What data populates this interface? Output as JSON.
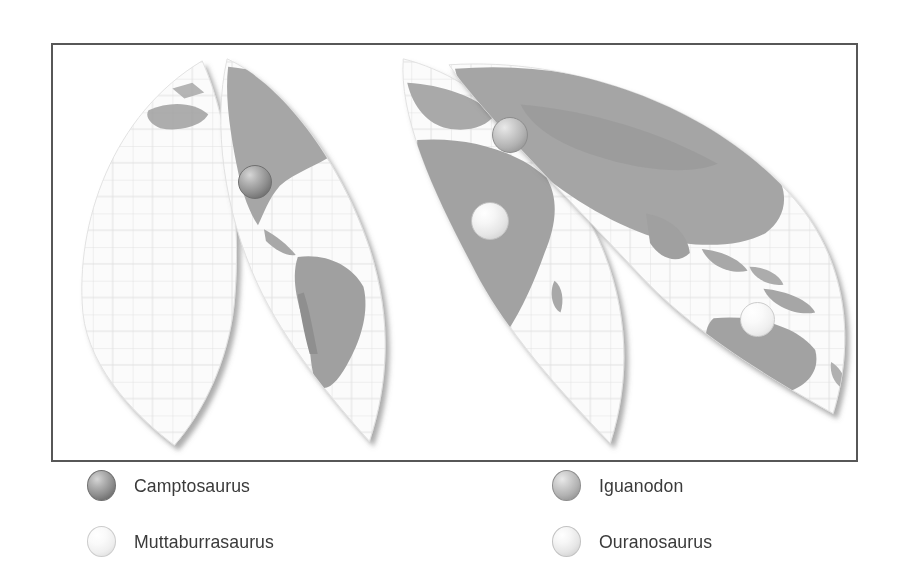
{
  "figure": {
    "type": "distribution-map",
    "projection": "interrupted-goode-homolosine",
    "frame_border_color": "#575757",
    "background_color": "#ffffff",
    "land_color": "#a8a8a8",
    "ocean_color": "#fafafa",
    "graticule_color": "#d8d8d8"
  },
  "map": {
    "markers": [
      {
        "name": "Camptosaurus",
        "region": "North America",
        "x": 253,
        "y": 180,
        "diameter": 34,
        "shade": "sph-dark"
      },
      {
        "name": "Iguanodon",
        "region": "Europe",
        "x": 508,
        "y": 133,
        "diameter": 36,
        "shade": "sph-mid"
      },
      {
        "name": "Ouranosaurus",
        "region": "Africa",
        "x": 488,
        "y": 219,
        "diameter": 38,
        "shade": "sph-light"
      },
      {
        "name": "Muttaburrasaurus",
        "region": "Australia",
        "x": 755,
        "y": 317,
        "diameter": 35,
        "shade": "sph-pale"
      }
    ]
  },
  "legend": {
    "entries": [
      {
        "label": "Camptosaurus",
        "shade": "sph-dark",
        "column": 0,
        "row": 0
      },
      {
        "label": "Muttaburrasaurus",
        "shade": "sph-pale",
        "column": 0,
        "row": 1
      },
      {
        "label": "Iguanodon",
        "shade": "sph-mid",
        "column": 1,
        "row": 0
      },
      {
        "label": "Ouranosaurus",
        "shade": "sph-light",
        "column": 1,
        "row": 1
      }
    ],
    "column_x": [
      36,
      501
    ],
    "row_y": [
      8,
      64
    ]
  }
}
